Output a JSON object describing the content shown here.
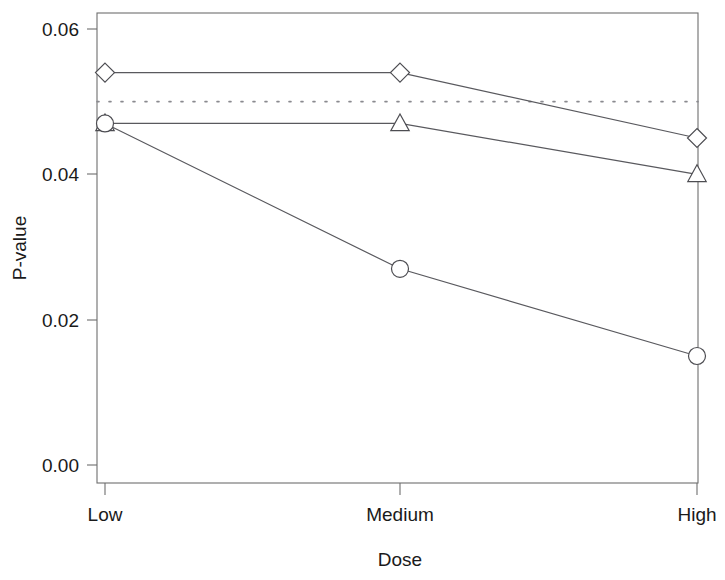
{
  "chart_data": {
    "type": "line",
    "title": "",
    "xlabel": "Dose",
    "ylabel": "P-value",
    "categories": [
      "Low",
      "Medium",
      "High"
    ],
    "ylim": [
      0.0,
      0.0625
    ],
    "yticks": [
      0.0,
      0.02,
      0.04,
      0.06
    ],
    "ytick_labels": [
      "0.00",
      "0.02",
      "0.04",
      "0.06"
    ],
    "grid": false,
    "legend": "none",
    "series": [
      {
        "name": "diamond-series",
        "marker": "diamond",
        "values": [
          0.054,
          0.054,
          0.045
        ]
      },
      {
        "name": "triangle-series",
        "marker": "triangle",
        "values": [
          0.047,
          0.047,
          0.04
        ]
      },
      {
        "name": "circle-series",
        "marker": "circle",
        "values": [
          0.047,
          0.027,
          0.015
        ]
      }
    ],
    "annotations": [
      {
        "name": "significance-threshold",
        "type": "hline",
        "value": 0.05,
        "style": "dotted"
      }
    ]
  },
  "axes": {
    "y_title": "P-value",
    "x_title": "Dose",
    "y_tick_0": "0.00",
    "y_tick_1": "0.02",
    "y_tick_2": "0.04",
    "y_tick_3": "0.06",
    "x_tick_0": "Low",
    "x_tick_1": "Medium",
    "x_tick_2": "High"
  },
  "colors": {
    "line": "#59595e",
    "marker_stroke": "#4d4d52",
    "marker_fill": "#ffffff",
    "axis": "#6e6e6e",
    "threshold": "#8a8a8f",
    "text": "#1a1a1a",
    "background": "#ffffff"
  }
}
